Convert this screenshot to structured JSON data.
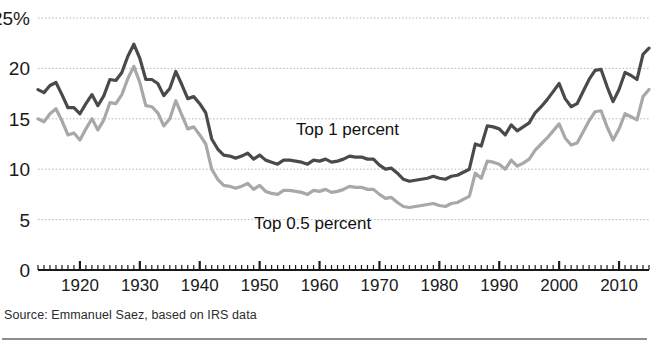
{
  "source_note": "Source: Emmanuel Saez, based on IRS data",
  "annotations": {
    "top1": "Top 1 percent",
    "top05": "Top 0.5 percent"
  },
  "colors": {
    "top1_line": "#4a4a4a",
    "top05_line": "#a8a8a8",
    "gridline": "#b9b9b9",
    "axis": "#1a1a1a",
    "text": "#1a1a1a"
  },
  "axes": {
    "y_ticks": [
      "25%",
      "20",
      "15",
      "10",
      "5",
      "0"
    ],
    "y_tick_values": [
      25,
      20,
      15,
      10,
      5,
      0
    ],
    "x_ticks": [
      "1920",
      "1930",
      "1940",
      "1950",
      "1960",
      "1970",
      "1980",
      "1990",
      "2000",
      "2010"
    ],
    "x_tick_values": [
      1920,
      1930,
      1940,
      1950,
      1960,
      1970,
      1980,
      1990,
      2000,
      2010
    ]
  },
  "chart_data": {
    "type": "line",
    "title": "",
    "subtitle": "",
    "xlabel": "",
    "ylabel": "",
    "xlim": [
      1913,
      2015
    ],
    "ylim": [
      0,
      25
    ],
    "grid": true,
    "legend_position": "inline-annotation",
    "x": [
      1913,
      1914,
      1915,
      1916,
      1917,
      1918,
      1919,
      1920,
      1921,
      1922,
      1923,
      1924,
      1925,
      1926,
      1927,
      1928,
      1929,
      1930,
      1931,
      1932,
      1933,
      1934,
      1935,
      1936,
      1937,
      1938,
      1939,
      1940,
      1941,
      1942,
      1943,
      1944,
      1945,
      1946,
      1947,
      1948,
      1949,
      1950,
      1951,
      1952,
      1953,
      1954,
      1955,
      1956,
      1957,
      1958,
      1959,
      1960,
      1961,
      1962,
      1963,
      1964,
      1965,
      1966,
      1967,
      1968,
      1969,
      1970,
      1971,
      1972,
      1973,
      1974,
      1975,
      1976,
      1977,
      1978,
      1979,
      1980,
      1981,
      1982,
      1983,
      1984,
      1985,
      1986,
      1987,
      1988,
      1989,
      1990,
      1991,
      1992,
      1993,
      1994,
      1995,
      1996,
      1997,
      1998,
      1999,
      2000,
      2001,
      2002,
      2003,
      2004,
      2005,
      2006,
      2007,
      2008,
      2009,
      2010,
      2011,
      2012,
      2013,
      2014,
      2015
    ],
    "series": [
      {
        "name": "Top 1 percent",
        "color": "#4a4a4a",
        "values": [
          17.9,
          17.6,
          18.3,
          18.6,
          17.4,
          16.1,
          16.1,
          15.5,
          16.5,
          17.4,
          16.3,
          17.3,
          18.9,
          18.8,
          19.6,
          21.2,
          22.4,
          21.0,
          18.9,
          18.9,
          18.5,
          17.3,
          18.0,
          19.7,
          18.4,
          17.0,
          17.2,
          16.5,
          15.6,
          13.0,
          12.0,
          11.4,
          11.3,
          11.1,
          11.3,
          11.6,
          11.0,
          11.4,
          10.9,
          10.7,
          10.5,
          10.9,
          10.9,
          10.8,
          10.7,
          10.5,
          10.9,
          10.8,
          11.0,
          10.7,
          10.8,
          11.0,
          11.3,
          11.2,
          11.2,
          11.0,
          11.0,
          10.4,
          10.0,
          10.1,
          9.6,
          9.0,
          8.8,
          8.9,
          9.0,
          9.1,
          9.3,
          9.1,
          9.0,
          9.3,
          9.4,
          9.7,
          10.0,
          12.5,
          12.3,
          14.3,
          14.2,
          14.0,
          13.4,
          14.4,
          13.8,
          14.2,
          14.6,
          15.6,
          16.2,
          16.9,
          17.7,
          18.5,
          17.0,
          16.2,
          16.5,
          17.7,
          18.9,
          19.8,
          19.9,
          18.2,
          16.7,
          17.9,
          19.6,
          19.3,
          18.9,
          21.4,
          22.0
        ]
      },
      {
        "name": "Top 0.5 percent",
        "color": "#a8a8a8",
        "values": [
          15.0,
          14.7,
          15.5,
          16.0,
          14.8,
          13.4,
          13.6,
          12.9,
          14.0,
          15.0,
          13.9,
          14.9,
          16.6,
          16.5,
          17.4,
          19.0,
          20.2,
          18.6,
          16.3,
          16.2,
          15.6,
          14.3,
          15.0,
          16.8,
          15.4,
          14.0,
          14.2,
          13.4,
          12.5,
          10.0,
          9.0,
          8.4,
          8.3,
          8.1,
          8.3,
          8.6,
          8.0,
          8.4,
          7.8,
          7.6,
          7.5,
          7.9,
          7.9,
          7.8,
          7.7,
          7.5,
          7.9,
          7.8,
          8.0,
          7.7,
          7.8,
          8.0,
          8.3,
          8.2,
          8.2,
          8.0,
          8.0,
          7.5,
          7.1,
          7.2,
          6.7,
          6.3,
          6.2,
          6.3,
          6.4,
          6.5,
          6.6,
          6.4,
          6.3,
          6.6,
          6.7,
          7.0,
          7.3,
          9.6,
          9.1,
          10.8,
          10.7,
          10.5,
          10.0,
          10.9,
          10.3,
          10.6,
          11.0,
          11.9,
          12.5,
          13.1,
          13.8,
          14.5,
          13.1,
          12.4,
          12.6,
          13.7,
          14.8,
          15.7,
          15.8,
          14.2,
          12.9,
          14.0,
          15.5,
          15.2,
          14.9,
          17.2,
          17.9
        ]
      }
    ]
  }
}
